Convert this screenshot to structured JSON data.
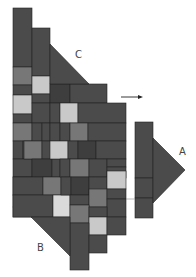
{
  "diagram": {
    "labels": {
      "a": "A",
      "b": "B",
      "c": "C"
    },
    "arrow_direction": "right",
    "colors": {
      "dark": "#4b4b4b",
      "darker": "#3e3e3e",
      "medium": "#777777",
      "light": "#c9c9c9",
      "lighter": "#dadada",
      "seam": "#222222",
      "background": "#ffffff"
    }
  }
}
